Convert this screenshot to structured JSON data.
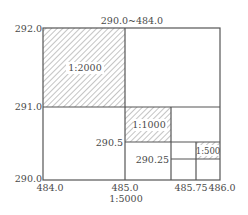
{
  "diagram": {
    "title": "290.0~484.0",
    "bottom_label": "1:5000",
    "y_ticks": [
      "292.0",
      "291.0",
      "290.0"
    ],
    "x_ticks": [
      "484.0",
      "485.0",
      "485.75",
      "486.0"
    ],
    "inner_labels": {
      "y_290_5": "290.5",
      "y_290_25": "290.25"
    },
    "sheets": [
      {
        "scale": "1:2000",
        "x_range": [
          484.0,
          485.0
        ],
        "y_range": [
          291.0,
          292.0
        ],
        "hatched": true
      },
      {
        "scale": "1:1000",
        "x_range": [
          485.0,
          485.5
        ],
        "y_range": [
          290.5,
          291.0
        ],
        "hatched": true
      },
      {
        "scale": "1:500",
        "x_range": [
          485.75,
          486.0
        ],
        "y_range": [
          290.25,
          290.5
        ],
        "hatched": true
      }
    ],
    "colors": {
      "line": "#555555",
      "hatch": "#8a8a8a",
      "text": "#4a4a4a",
      "background": "#ffffff"
    }
  }
}
